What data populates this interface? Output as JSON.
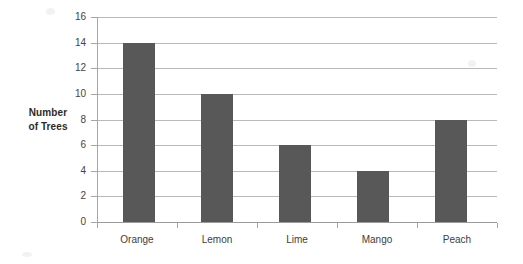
{
  "chart_data": {
    "type": "bar",
    "title": "",
    "subtitle": "",
    "xlabel": "",
    "ylabel": "Number of Trees",
    "ylabel_lines": [
      "Number",
      "of Trees"
    ],
    "categories": [
      "Orange",
      "Lemon",
      "Lime",
      "Mango",
      "Peach"
    ],
    "values": [
      14,
      10,
      6,
      4,
      8
    ],
    "ylim": [
      0,
      16
    ],
    "y_ticks": [
      0,
      2,
      4,
      6,
      8,
      10,
      12,
      14,
      16
    ],
    "y_tick_labels": [
      "0",
      "2",
      "4",
      "6",
      "8",
      "10",
      "12",
      "14",
      "16"
    ],
    "grid": true,
    "grid_axis": "y",
    "legend": false,
    "legend_position": "none",
    "bar_color": "#585858",
    "grid_color": "#b9b9b9",
    "axis_color": "#a6a6a6",
    "background_color": "#ffffff"
  }
}
